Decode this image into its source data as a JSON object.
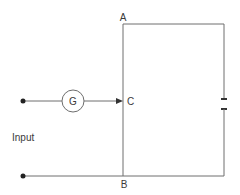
{
  "diagram": {
    "labels": {
      "node_a": "A",
      "node_b": "B",
      "node_c": "C",
      "input": "Input",
      "galvanometer": "G"
    },
    "components": [
      {
        "type": "terminal",
        "name": "input-terminal-top"
      },
      {
        "type": "terminal",
        "name": "input-terminal-bottom"
      },
      {
        "type": "galvanometer",
        "symbol": "G"
      },
      {
        "type": "slide-wire",
        "endpoints": [
          "A",
          "B"
        ],
        "contact": "C"
      },
      {
        "type": "cell",
        "position": "right-branch"
      }
    ],
    "colors": {
      "line": "#6e6e6e",
      "text": "#3a3a3a",
      "background": "#ffffff"
    }
  }
}
